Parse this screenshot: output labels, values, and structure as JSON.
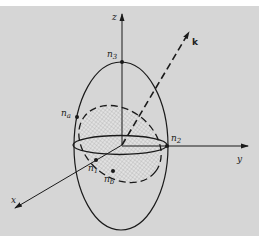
{
  "figure": {
    "background": "#d8d8d8",
    "ink": "#1a1a1a",
    "axes": {
      "x": {
        "label": "x"
      },
      "y": {
        "label": "y"
      },
      "z": {
        "label": "z"
      }
    },
    "wave_vector": {
      "label": "k"
    },
    "points": {
      "n1": {
        "base": "n",
        "sub": "1"
      },
      "n2": {
        "base": "n",
        "sub": "2"
      },
      "n3": {
        "base": "n",
        "sub": "3"
      },
      "na": {
        "base": "n",
        "sub": "a"
      },
      "nb": {
        "base": "n",
        "sub": "b"
      }
    }
  }
}
